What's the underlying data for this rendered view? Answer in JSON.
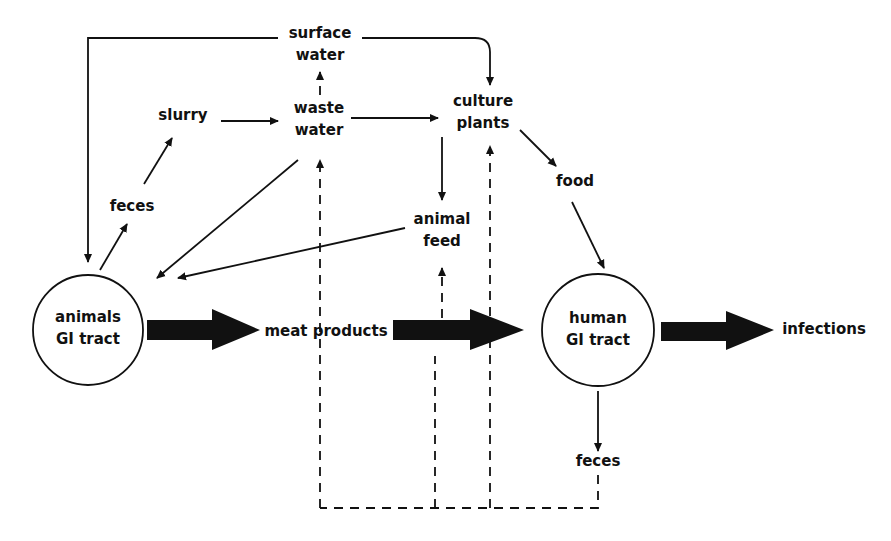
{
  "diagram": {
    "type": "flow-diagram",
    "colors": {
      "stroke": "#111111",
      "background": "#ffffff"
    },
    "nodes": {
      "surface_water": {
        "line1": "surface",
        "line2": "water"
      },
      "slurry": {
        "label": "slurry"
      },
      "waste_water": {
        "line1": "waste",
        "line2": "water"
      },
      "culture_plants": {
        "line1": "culture",
        "line2": "plants"
      },
      "feces_animals": {
        "label": "feces"
      },
      "food": {
        "label": "food"
      },
      "animal_feed": {
        "line1": "animal",
        "line2": "feed"
      },
      "animals_gi": {
        "line1": "animals",
        "line2": "GI tract"
      },
      "meat_products": {
        "label": "meat products"
      },
      "human_gi": {
        "line1": "human",
        "line2": "GI tract"
      },
      "infections": {
        "label": "infections"
      },
      "feces_human": {
        "label": "feces"
      }
    },
    "edges": [
      {
        "from": "surface water",
        "to": "animals GI tract",
        "style": "solid"
      },
      {
        "from": "surface water",
        "to": "culture plants",
        "style": "solid"
      },
      {
        "from": "animals GI tract",
        "to": "feces",
        "style": "solid"
      },
      {
        "from": "feces",
        "to": "slurry",
        "style": "solid"
      },
      {
        "from": "slurry",
        "to": "waste water",
        "style": "solid"
      },
      {
        "from": "waste water",
        "to": "surface water",
        "style": "dashed"
      },
      {
        "from": "waste water",
        "to": "culture plants",
        "style": "solid"
      },
      {
        "from": "waste water",
        "to": "animals GI tract",
        "style": "solid"
      },
      {
        "from": "culture plants",
        "to": "animal feed",
        "style": "solid"
      },
      {
        "from": "culture plants",
        "to": "food",
        "style": "solid"
      },
      {
        "from": "food",
        "to": "human GI tract",
        "style": "solid"
      },
      {
        "from": "animal feed",
        "to": "animals GI tract",
        "style": "solid"
      },
      {
        "from": "animals GI tract",
        "to": "meat products",
        "style": "bold"
      },
      {
        "from": "meat products",
        "to": "human GI tract",
        "style": "bold"
      },
      {
        "from": "human GI tract",
        "to": "infections",
        "style": "bold"
      },
      {
        "from": "human GI tract",
        "to": "feces",
        "style": "solid"
      },
      {
        "from": "feces (human)",
        "to": "waste water",
        "style": "dashed"
      },
      {
        "from": "feces (human)",
        "to": "animal feed",
        "style": "dashed"
      },
      {
        "from": "feces (human)",
        "to": "culture plants",
        "style": "dashed"
      }
    ]
  }
}
